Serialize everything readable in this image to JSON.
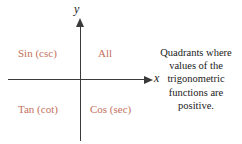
{
  "figure": {
    "colors": {
      "quadrant_label": "#c4705e",
      "axis": "#3a3a3a",
      "text": "#1a1a1a",
      "background": "#ffffff"
    }
  },
  "axes": {
    "y_label": "y",
    "x_label": "x"
  },
  "quadrants": [
    {
      "id": "quadrant-2",
      "label": "Sin (csc)"
    },
    {
      "id": "quadrant-1",
      "label": "All"
    },
    {
      "id": "quadrant-3",
      "label": "Tan (cot)"
    },
    {
      "id": "quadrant-4",
      "label": "Cos (sec)"
    }
  ],
  "caption": {
    "full_text": "Quadrants where values of the trigonometric functions are positive.",
    "lines": [
      "Quadrants where",
      "values of the",
      "trigonometric",
      "functions are",
      "positive."
    ]
  }
}
